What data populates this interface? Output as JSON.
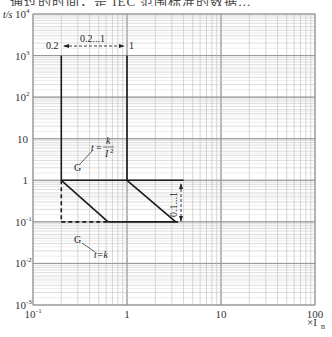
{
  "page_header_fragment": "通过的时间，是 IEC 范围标准的数据...",
  "chart_data": {
    "type": "line",
    "title": "",
    "xlabel": "×I_n",
    "ylabel": "t/s",
    "xscale": "log",
    "yscale": "log",
    "xlim": [
      0.1,
      100
    ],
    "ylim": [
      0.001,
      10000
    ],
    "grid": true,
    "x_ticks": [
      {
        "value": 0.1,
        "label": "10",
        "sup": "-1"
      },
      {
        "value": 1,
        "label": "1",
        "sup": ""
      },
      {
        "value": 10,
        "label": "10",
        "sup": ""
      },
      {
        "value": 100,
        "label": "100",
        "sup": ""
      }
    ],
    "y_ticks": [
      {
        "value": 10000,
        "label": "10",
        "sup": "4"
      },
      {
        "value": 1000,
        "label": "10",
        "sup": "3"
      },
      {
        "value": 100,
        "label": "10",
        "sup": "2"
      },
      {
        "value": 10,
        "label": "10",
        "sup": ""
      },
      {
        "value": 1,
        "label": "1",
        "sup": ""
      },
      {
        "value": 0.1,
        "label": "10",
        "sup": "-1"
      },
      {
        "value": 0.01,
        "label": "10",
        "sup": "-2"
      },
      {
        "value": 0.001,
        "label": "10",
        "sup": "-3"
      }
    ],
    "x_axis_unit": "×I",
    "x_axis_unit_sub": "n",
    "y_axis_label": "t/s",
    "series": [
      {
        "name": "long-delay band left boundary",
        "style": "solid",
        "points": [
          [
            0.2,
            1000
          ],
          [
            0.2,
            1
          ]
        ]
      },
      {
        "name": "long-delay band right boundary",
        "style": "solid",
        "points": [
          [
            1,
            1000
          ],
          [
            1,
            1
          ]
        ]
      },
      {
        "name": "t = k / I^2 (lower left)",
        "style": "solid",
        "points": [
          [
            0.2,
            1
          ],
          [
            0.63,
            0.1
          ]
        ]
      },
      {
        "name": "t = k / I^2 (upper right)",
        "style": "solid",
        "points": [
          [
            1,
            1
          ],
          [
            3.3,
            0.1
          ]
        ]
      },
      {
        "name": "t = 1 s upper limit",
        "style": "solid",
        "points": [
          [
            0.2,
            1
          ],
          [
            4,
            1
          ]
        ]
      },
      {
        "name": "t = k (0.1 s) definite time",
        "style": "solid",
        "points": [
          [
            0.63,
            0.1
          ],
          [
            3.5,
            0.1
          ]
        ]
      },
      {
        "name": "t = k dashed extension",
        "style": "dashed",
        "points": [
          [
            0.2,
            0.1
          ],
          [
            0.63,
            0.1
          ]
        ]
      },
      {
        "name": "vertical dashed at 0.2",
        "style": "dashed",
        "points": [
          [
            0.2,
            1
          ],
          [
            0.2,
            0.1
          ]
        ]
      }
    ],
    "annotations": [
      {
        "text": "0.2",
        "x": 0.2,
        "y": 1000
      },
      {
        "text": "0.2...1",
        "x": 0.45,
        "y": 1000,
        "kind": "dimension-arrow"
      },
      {
        "text": "1",
        "x": 1,
        "y": 1000
      },
      {
        "text": "G",
        "target": "t = k / I^2",
        "formula": "t = k / I²"
      },
      {
        "text": "G",
        "target": "t = k",
        "formula": "t = k"
      },
      {
        "text": "0.1...1",
        "x": 4,
        "y": 0.32,
        "kind": "vertical-dimension-arrow"
      }
    ]
  },
  "labels": {
    "y_axis": "t/s",
    "x_unit_main": "×I",
    "x_unit_sub": "n",
    "dim_top_left": "0.2",
    "dim_top_mid": "0.2...1",
    "dim_top_right": "1",
    "g_upper": "G",
    "formula_upper_t": "t",
    "formula_upper_eq": "=",
    "formula_upper_num": "k",
    "formula_upper_den": "I",
    "formula_upper_den_sup": "2",
    "g_lower": "G",
    "formula_lower": "t=k",
    "dim_right": "0.1...1"
  }
}
